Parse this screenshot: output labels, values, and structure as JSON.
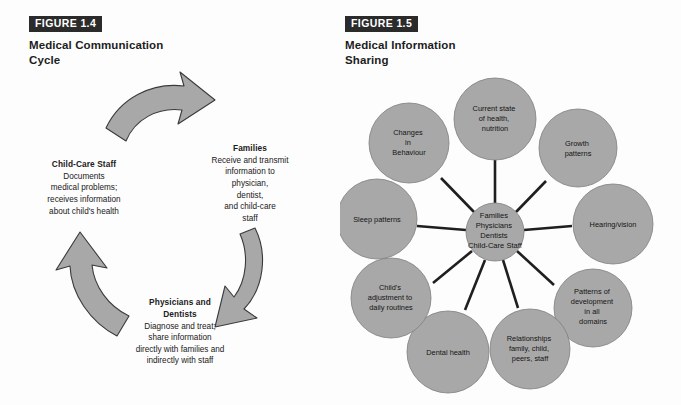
{
  "figure_left": {
    "tag": "FIGURE 1.4",
    "title_line1": "Medical Communication",
    "title_line2": "Cycle",
    "nodes": [
      {
        "id": "families",
        "heading": "Families",
        "body": "Receive and transmit\ninformation to\nphysician,\ndentist,\nand child-care\nstaff"
      },
      {
        "id": "physicians-dentists",
        "heading": "Physicians and\nDentists",
        "body": "Diagnose and treat;\nshare information\ndirectly with families and\nindirectly with staff"
      },
      {
        "id": "child-care-staff",
        "heading": "Child-Care Staff",
        "body": "Documents\nmedical problems;\nreceives information\nabout child's health"
      }
    ],
    "arrows": [
      {
        "id": "arrow-top-right",
        "direction": "clockwise"
      },
      {
        "id": "arrow-bottom-right",
        "direction": "clockwise"
      },
      {
        "id": "arrow-left-up",
        "direction": "clockwise"
      }
    ]
  },
  "figure_right": {
    "tag": "FIGURE 1.5",
    "title_line1": "Medical Information",
    "title_line2": "Sharing",
    "center_node": {
      "id": "center-participants",
      "lines": [
        "Families",
        "Physicians",
        "Dentists",
        "Child-Care Staff"
      ]
    },
    "spokes": [
      {
        "id": "current-state-health",
        "lines": [
          "Current state",
          "of health,",
          "nutrition"
        ]
      },
      {
        "id": "growth-patterns",
        "lines": [
          "Growth",
          "patterns"
        ]
      },
      {
        "id": "hearing-vision",
        "lines": [
          "Hearing/vision"
        ]
      },
      {
        "id": "patterns-development",
        "lines": [
          "Patterns of",
          "development",
          "in all",
          "domains"
        ]
      },
      {
        "id": "relationships",
        "lines": [
          "Relationships",
          "family, child,",
          "peers, staff"
        ]
      },
      {
        "id": "dental-health",
        "lines": [
          "Dental health"
        ]
      },
      {
        "id": "childs-adjustment",
        "lines": [
          "Child's",
          "adjustment to",
          "daily routines"
        ]
      },
      {
        "id": "sleep-patterns",
        "lines": [
          "Sleep patterns"
        ]
      },
      {
        "id": "changes-behaviour",
        "lines": [
          "Changes",
          "in",
          "Behaviour"
        ]
      }
    ]
  },
  "colors": {
    "fill_gray": "#a8a8a8",
    "stroke_dark": "#2b2b2b",
    "tag_bg": "#2b2b2b",
    "tag_fg": "#ffffff",
    "page_bg": "#fdfdfd",
    "text": "#1a1a1a"
  }
}
